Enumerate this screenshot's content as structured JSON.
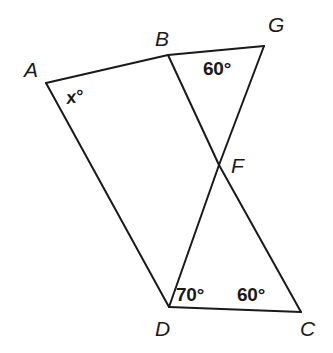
{
  "figure": {
    "type": "geometry-diagram",
    "stroke_color": "#1a1a1a",
    "background_color": "#ffffff",
    "stroke_width": 2,
    "points": {
      "A": {
        "x": 46,
        "y": 83,
        "label": "A"
      },
      "B": {
        "x": 168,
        "y": 55,
        "label": "B"
      },
      "G": {
        "x": 264,
        "y": 46,
        "label": "G"
      },
      "F": {
        "x": 219,
        "y": 165,
        "label": "F"
      },
      "D": {
        "x": 169,
        "y": 307,
        "label": "D"
      },
      "C": {
        "x": 301,
        "y": 312,
        "label": "C"
      }
    },
    "segments": [
      {
        "name": "segment-A-G",
        "from": "A",
        "to": "G",
        "via": [
          "B"
        ]
      },
      {
        "name": "segment-A-D",
        "from": "A",
        "to": "D"
      },
      {
        "name": "segment-B-C",
        "from": "B",
        "to": "C",
        "via": [
          "F"
        ]
      },
      {
        "name": "segment-G-D",
        "from": "G",
        "to": "D",
        "via": [
          "F"
        ]
      },
      {
        "name": "segment-D-C",
        "from": "D",
        "to": "C"
      }
    ],
    "vertex_labels": [
      {
        "key": "A",
        "text": "A",
        "x": 24,
        "y": 59
      },
      {
        "key": "B",
        "text": "B",
        "x": 155,
        "y": 28
      },
      {
        "key": "G",
        "text": "G",
        "x": 268,
        "y": 14
      },
      {
        "key": "F",
        "text": "F",
        "x": 231,
        "y": 155
      },
      {
        "key": "D",
        "text": "D",
        "x": 155,
        "y": 318
      },
      {
        "key": "C",
        "text": "C",
        "x": 300,
        "y": 318
      }
    ],
    "angle_labels": [
      {
        "name": "angle-at-A",
        "at": "A",
        "text": "x°",
        "x": 66,
        "y": 88,
        "variable": true
      },
      {
        "name": "angle-at-G",
        "at": "G",
        "text": "60°",
        "x": 203,
        "y": 59,
        "variable": false
      },
      {
        "name": "angle-at-D",
        "at": "D",
        "text": "70°",
        "x": 176,
        "y": 285,
        "variable": false
      },
      {
        "name": "angle-at-C",
        "at": "C",
        "text": "60°",
        "x": 237,
        "y": 285,
        "variable": false
      }
    ]
  }
}
